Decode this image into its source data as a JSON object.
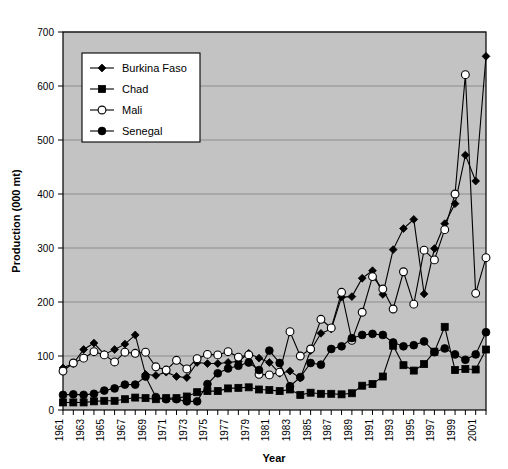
{
  "chart_data": {
    "type": "line",
    "title": "",
    "xlabel": "Year",
    "ylabel": "Production (000 mt)",
    "xlim": [
      1961,
      2002
    ],
    "ylim": [
      0,
      700
    ],
    "ytick_values": [
      0,
      100,
      200,
      300,
      400,
      500,
      600,
      700
    ],
    "ytick_labels": [
      "0",
      "100",
      "200",
      "300",
      "400",
      "500",
      "600",
      "700"
    ],
    "xtick_labels": [
      "1961",
      "1963",
      "1965",
      "1967",
      "1969",
      "1971",
      "1973",
      "1975",
      "1977",
      "1979",
      "1981",
      "1983",
      "1985",
      "1987",
      "1989",
      "1991",
      "1993",
      "1995",
      "1997",
      "1999",
      "2001"
    ],
    "grid": "horizontal",
    "legend_position": "top-left-inside",
    "plot_background": "#c3c3c3",
    "line_color": "#000000",
    "x": [
      1961,
      1962,
      1963,
      1964,
      1965,
      1966,
      1967,
      1968,
      1969,
      1970,
      1971,
      1972,
      1973,
      1974,
      1975,
      1976,
      1977,
      1978,
      1979,
      1980,
      1981,
      1982,
      1983,
      1984,
      1985,
      1986,
      1987,
      1988,
      1989,
      1990,
      1991,
      1992,
      1993,
      1994,
      1995,
      1996,
      1997,
      1998,
      1999,
      2000,
      2001,
      2002
    ],
    "series": [
      {
        "name": "Burkina Faso",
        "marker": "filled-diamond",
        "values": [
          78,
          86,
          112,
          124,
          103,
          112,
          122,
          139,
          66,
          64,
          70,
          62,
          60,
          88,
          86,
          86,
          88,
          90,
          105,
          96,
          88,
          68,
          72,
          59,
          110,
          142,
          150,
          209,
          210,
          244,
          258,
          214,
          297,
          336,
          353,
          215,
          299,
          345,
          382,
          472,
          424,
          655
        ]
      },
      {
        "name": "Chad",
        "marker": "filled-square",
        "values": [
          14,
          14,
          14,
          16,
          17,
          17,
          20,
          23,
          22,
          20,
          22,
          22,
          25,
          33,
          35,
          35,
          40,
          41,
          42,
          38,
          37,
          35,
          38,
          28,
          32,
          30,
          30,
          29,
          31,
          45,
          48,
          62,
          119,
          83,
          73,
          85,
          108,
          154,
          74,
          76,
          75,
          112
        ]
      },
      {
        "name": "Mali",
        "marker": "open-circle",
        "values": [
          72,
          87,
          96,
          108,
          102,
          89,
          107,
          105,
          107,
          80,
          74,
          92,
          76,
          95,
          103,
          102,
          108,
          98,
          102,
          66,
          65,
          70,
          145,
          100,
          113,
          168,
          152,
          218,
          129,
          181,
          247,
          224,
          187,
          256,
          196,
          296,
          278,
          334,
          400,
          621,
          216,
          282
        ]
      },
      {
        "name": "Senegal",
        "marker": "filled-circle",
        "values": [
          28,
          29,
          28,
          30,
          36,
          40,
          47,
          47,
          62,
          24,
          20,
          20,
          16,
          16,
          48,
          68,
          77,
          82,
          88,
          74,
          110,
          87,
          44,
          61,
          87,
          84,
          113,
          118,
          133,
          139,
          141,
          139,
          125,
          118,
          120,
          127,
          107,
          114,
          103,
          93,
          103,
          144
        ]
      }
    ]
  },
  "legend": {
    "entries": [
      {
        "label": "Burkina Faso",
        "marker": "filled-diamond"
      },
      {
        "label": "Chad",
        "marker": "filled-square"
      },
      {
        "label": "Mali",
        "marker": "open-circle"
      },
      {
        "label": "Senegal",
        "marker": "filled-circle"
      }
    ]
  }
}
